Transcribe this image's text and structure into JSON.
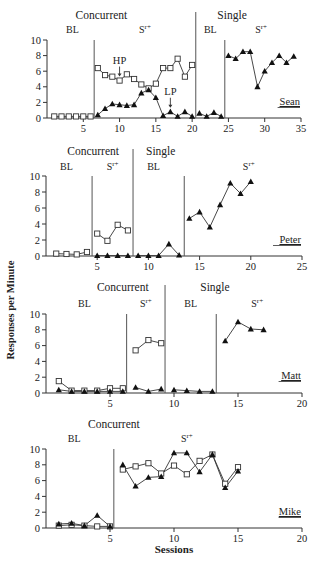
{
  "figure": {
    "y_axis_label": "Responses per Minute",
    "x_axis_label": "Sessions"
  },
  "chart_data": [
    {
      "type": "line",
      "participant": "Sean",
      "xlim": [
        0,
        35
      ],
      "ylim": [
        0,
        10
      ],
      "xticks": [
        5,
        10,
        15,
        20,
        25,
        30,
        35
      ],
      "yticks": [
        0,
        2,
        4,
        6,
        8,
        10
      ],
      "grid": false,
      "phase_lines": [
        6.5,
        20.5,
        24.5
      ],
      "condition_labels": [
        {
          "text": "Concurrent",
          "x": 7.5,
          "row": 0
        },
        {
          "text": "Single",
          "x": 25.5,
          "row": 0
        },
        {
          "text": "BL",
          "x": 3.5,
          "row": 1
        },
        {
          "text": "Sr+",
          "x": 13.5,
          "row": 1
        },
        {
          "text": "BL",
          "x": 22.5,
          "row": 1
        },
        {
          "text": "Sr+",
          "x": 29.5,
          "row": 1
        }
      ],
      "annotations": [
        {
          "text": "HP",
          "x": 10,
          "y": 4.8,
          "arrow": true
        },
        {
          "text": "LP",
          "x": 17,
          "y": 0.8,
          "arrow": true
        }
      ],
      "series": [
        {
          "name": "HP",
          "marker": "square-open",
          "segments": [
            [
              [
                1,
                0.2
              ],
              [
                2,
                0.2
              ],
              [
                3,
                0.2
              ],
              [
                4,
                0.2
              ],
              [
                5,
                0.2
              ],
              [
                6,
                0.2
              ]
            ],
            [
              [
                7,
                6.4
              ],
              [
                8,
                5.5
              ],
              [
                9,
                5.3
              ],
              [
                10,
                4.8
              ],
              [
                11,
                5.6
              ],
              [
                12,
                5.0
              ],
              [
                13,
                4.3
              ],
              [
                14,
                3.8
              ],
              [
                15,
                4.4
              ],
              [
                16,
                6.4
              ],
              [
                17,
                6.4
              ],
              [
                18,
                7.6
              ],
              [
                19,
                5.3
              ],
              [
                20,
                6.8
              ]
            ]
          ]
        },
        {
          "name": "LP",
          "marker": "triangle-filled",
          "segments": [
            [
              [
                7,
                0.4
              ],
              [
                8,
                1.2
              ],
              [
                9,
                1.8
              ],
              [
                10,
                1.7
              ],
              [
                11,
                1.6
              ],
              [
                12,
                1.7
              ],
              [
                13,
                3.2
              ],
              [
                14,
                3.6
              ],
              [
                15,
                2.6
              ],
              [
                16,
                0.3
              ],
              [
                17,
                0.8
              ],
              [
                18,
                0.2
              ],
              [
                19,
                0.8
              ],
              [
                20,
                0.2
              ]
            ],
            [
              [
                21,
                0.6
              ],
              [
                22,
                0.2
              ],
              [
                23,
                0.7
              ],
              [
                24,
                0.2
              ]
            ],
            [
              [
                25,
                8.0
              ],
              [
                26,
                7.6
              ],
              [
                27,
                8.5
              ],
              [
                28,
                8.5
              ],
              [
                29,
                4.0
              ],
              [
                30,
                6.0
              ],
              [
                31,
                7.1
              ],
              [
                32,
                8.0
              ],
              [
                33,
                7.1
              ],
              [
                34,
                7.9
              ]
            ]
          ]
        }
      ]
    },
    {
      "type": "line",
      "participant": "Peter",
      "xlim": [
        0,
        25
      ],
      "ylim": [
        0,
        10
      ],
      "xticks": [
        5,
        10,
        15,
        20,
        25
      ],
      "yticks": [
        0,
        2,
        4,
        6,
        8,
        10
      ],
      "grid": false,
      "phase_lines": [
        4.5,
        8.5,
        13.5
      ],
      "condition_labels": [
        {
          "text": "Concurrent",
          "x": 4.6,
          "row": 0
        },
        {
          "text": "Single",
          "x": 11.2,
          "row": 0
        },
        {
          "text": "BL",
          "x": 2.0,
          "row": 1
        },
        {
          "text": "Sr+",
          "x": 6.5,
          "row": 1
        },
        {
          "text": "BL",
          "x": 10.5,
          "row": 1
        },
        {
          "text": "Sr+",
          "x": 19.8,
          "row": 1
        }
      ],
      "annotations": [],
      "series": [
        {
          "name": "HP",
          "marker": "square-open",
          "segments": [
            [
              [
                1,
                0.3
              ],
              [
                2,
                0.25
              ],
              [
                3,
                0.2
              ],
              [
                4,
                0.5
              ]
            ],
            [
              [
                5,
                2.8
              ],
              [
                6,
                1.9
              ],
              [
                7,
                3.9
              ],
              [
                8,
                3.2
              ]
            ]
          ]
        },
        {
          "name": "LP",
          "marker": "triangle-filled",
          "segments": [
            [
              [
                5,
                0.05
              ],
              [
                6,
                0.05
              ],
              [
                7,
                0.05
              ],
              [
                8,
                0.05
              ]
            ],
            [
              [
                9,
                0.05
              ],
              [
                10,
                0.05
              ],
              [
                11,
                0.05
              ],
              [
                12,
                1.5
              ],
              [
                13,
                0.1
              ]
            ],
            [
              [
                14,
                4.7
              ],
              [
                15,
                5.5
              ],
              [
                16,
                3.6
              ],
              [
                17,
                6.4
              ],
              [
                18,
                9.1
              ],
              [
                19,
                7.8
              ],
              [
                20,
                9.3
              ]
            ]
          ]
        }
      ]
    },
    {
      "type": "line",
      "participant": "Matt",
      "xlim": [
        0,
        20
      ],
      "ylim": [
        0,
        10
      ],
      "xticks": [
        5,
        10,
        15,
        20
      ],
      "yticks": [
        0,
        2,
        4,
        6,
        8,
        10
      ],
      "grid": false,
      "phase_lines": [
        6.3,
        9.3,
        13.3
      ],
      "condition_labels": [
        {
          "text": "Concurrent",
          "x": 6.0,
          "row": 0
        },
        {
          "text": "Single",
          "x": 13.2,
          "row": 0
        },
        {
          "text": "BL",
          "x": 3.0,
          "row": 1
        },
        {
          "text": "Sr+",
          "x": 7.8,
          "row": 1
        },
        {
          "text": "BL",
          "x": 11.3,
          "row": 1
        },
        {
          "text": "Sr+",
          "x": 16.5,
          "row": 1
        }
      ],
      "annotations": [],
      "series": [
        {
          "name": "HP",
          "marker": "square-open",
          "segments": [
            [
              [
                1,
                1.5
              ],
              [
                2,
                0.3
              ],
              [
                3,
                0.3
              ],
              [
                4,
                0.3
              ],
              [
                5,
                0.6
              ],
              [
                6,
                0.6
              ]
            ],
            [
              [
                7,
                5.4
              ],
              [
                8,
                6.7
              ],
              [
                9,
                6.3
              ]
            ]
          ]
        },
        {
          "name": "LP",
          "marker": "triangle-filled",
          "segments": [
            [
              [
                1,
                0.4
              ],
              [
                2,
                0.2
              ],
              [
                3,
                0.2
              ],
              [
                4,
                0.2
              ],
              [
                5,
                0.2
              ],
              [
                6,
                0.2
              ]
            ],
            [
              [
                7,
                0.7
              ],
              [
                8,
                0.2
              ],
              [
                9,
                0.5
              ]
            ],
            [
              [
                10,
                0.4
              ],
              [
                11,
                0.3
              ],
              [
                12,
                0.2
              ],
              [
                13,
                0.2
              ]
            ],
            [
              [
                14,
                6.6
              ],
              [
                15,
                9.0
              ],
              [
                16,
                8.1
              ],
              [
                17,
                8.0
              ]
            ]
          ]
        }
      ]
    },
    {
      "type": "line",
      "participant": "Mike",
      "xlim": [
        0,
        20
      ],
      "ylim": [
        0,
        10
      ],
      "xticks": [
        5,
        10,
        15,
        20
      ],
      "yticks": [
        0,
        2,
        4,
        6,
        8,
        10
      ],
      "grid": false,
      "phase_lines": [
        5.3
      ],
      "condition_labels": [
        {
          "text": "Concurrent",
          "x": 5.3,
          "row": 0
        },
        {
          "text": "BL",
          "x": 2.2,
          "row": 1
        },
        {
          "text": "Sr+",
          "x": 11.0,
          "row": 1
        }
      ],
      "annotations": [],
      "series": [
        {
          "name": "HP",
          "marker": "square-open",
          "segments": [
            [
              [
                1,
                0.3
              ],
              [
                2,
                0.4
              ],
              [
                3,
                0.3
              ],
              [
                4,
                0.2
              ],
              [
                5,
                0.2
              ]
            ],
            [
              [
                6,
                7.4
              ],
              [
                7,
                7.8
              ],
              [
                8,
                8.2
              ],
              [
                9,
                6.9
              ],
              [
                10,
                7.9
              ],
              [
                11,
                6.8
              ],
              [
                12,
                8.5
              ],
              [
                13,
                9.3
              ],
              [
                14,
                5.6
              ],
              [
                15,
                7.7
              ]
            ]
          ]
        },
        {
          "name": "LP",
          "marker": "triangle-filled",
          "segments": [
            [
              [
                1,
                0.5
              ],
              [
                2,
                0.6
              ],
              [
                3,
                0.3
              ],
              [
                4,
                1.6
              ],
              [
                5,
                0.2
              ]
            ],
            [
              [
                6,
                8.0
              ],
              [
                7,
                5.3
              ],
              [
                8,
                6.4
              ],
              [
                9,
                6.5
              ],
              [
                10,
                9.5
              ],
              [
                11,
                9.5
              ],
              [
                12,
                7.1
              ],
              [
                13,
                9.3
              ],
              [
                14,
                5.1
              ],
              [
                15,
                7.2
              ]
            ]
          ]
        }
      ]
    }
  ],
  "layout": {
    "panels": [
      {
        "x0": 47,
        "x1": 301,
        "y10": 40,
        "y0": 118,
        "top_row0": 19,
        "top_row1": 33,
        "name_y": 105,
        "vline_top": 40,
        "divider_top": 12
      },
      {
        "x0": 46,
        "x1": 302,
        "y10": 176,
        "y0": 256,
        "top_row0": 155,
        "top_row1": 170,
        "name_y": 243,
        "vline_top": 176,
        "divider_top": 149
      },
      {
        "x0": 46,
        "x1": 302,
        "y10": 314,
        "y0": 393,
        "top_row0": 291,
        "top_row1": 307,
        "name_y": 379,
        "vline_top": 314,
        "divider_top": 285
      },
      {
        "x0": 46,
        "x1": 302,
        "y10": 449,
        "y0": 528,
        "top_row0": 428,
        "top_row1": 442,
        "name_y": 515,
        "vline_top": 449,
        "divider_top": 449
      }
    ]
  }
}
